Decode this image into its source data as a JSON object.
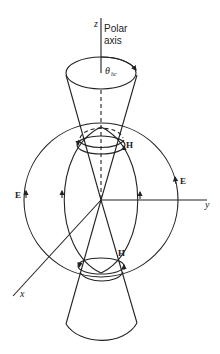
{
  "diagram": {
    "axes": {
      "z_label": "z",
      "z_caption_line1": "Polar",
      "z_caption_line2": "axis",
      "y_label": "y",
      "x_label": "x"
    },
    "angle": {
      "symbol": "θ",
      "subscript": "hc"
    },
    "field_labels": {
      "electric": "E",
      "magnetic": "H"
    },
    "colors": {
      "line": "#222222",
      "background": "#ffffff"
    }
  }
}
